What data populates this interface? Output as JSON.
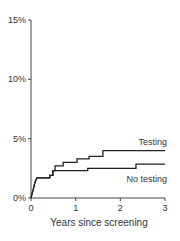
{
  "chart_data": {
    "type": "line",
    "subtype": "step (Kaplan-Meier style cumulative incidence)",
    "title": "",
    "xlabel": "Years since screening",
    "ylabel": "",
    "xlim": [
      0,
      3
    ],
    "ylim": [
      0,
      15
    ],
    "x_ticks": [
      0,
      1,
      2,
      3
    ],
    "x_tick_labels": [
      "0",
      "1",
      "2",
      "3"
    ],
    "y_ticks": [
      0,
      5,
      10,
      15
    ],
    "y_tick_labels": [
      "0%",
      "5%",
      "10%",
      "15%"
    ],
    "grid": false,
    "legend": "inline labels at right end of curves",
    "series": [
      {
        "name": "Testing",
        "label_position": "above curve, right end",
        "x": [
          0,
          0.02,
          0.05,
          0.08,
          0.13,
          0.42,
          0.49,
          0.54,
          0.72,
          1.03,
          1.3,
          1.61,
          3.0
        ],
        "y": [
          0,
          0.3,
          0.7,
          1.2,
          1.7,
          1.9,
          2.3,
          2.7,
          3.0,
          3.3,
          3.5,
          4.0,
          4.0
        ]
      },
      {
        "name": "No testing",
        "label_position": "below curve, right end",
        "x": [
          0,
          0.02,
          0.05,
          0.08,
          0.13,
          0.42,
          0.49,
          1.27,
          2.35,
          3.0
        ],
        "y": [
          0,
          0.3,
          0.7,
          1.2,
          1.7,
          1.9,
          2.3,
          2.5,
          2.85,
          2.85
        ]
      }
    ]
  },
  "layout": {
    "plot_left": 31,
    "plot_right": 165,
    "plot_top": 20,
    "plot_bottom": 198,
    "line_color": "#222222",
    "axis_color": "#444444"
  }
}
